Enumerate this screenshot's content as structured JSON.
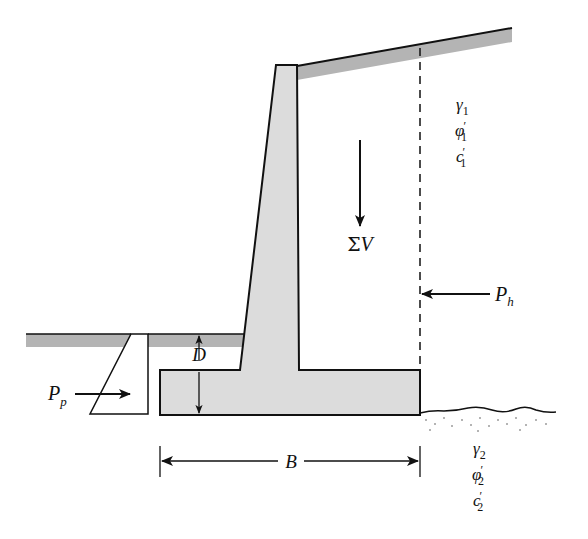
{
  "diagram": {
    "type": "cantilever-retaining-wall",
    "colors": {
      "concrete_fill": "#dcdcdc",
      "soil_strip_fill": "#b4b4b4",
      "stroke": "#111111",
      "background": "#ffffff"
    },
    "labels": {
      "vertical_force": {
        "symbol": "Σ",
        "var": "V"
      },
      "active_force": {
        "var": "P",
        "sub": "h"
      },
      "passive_force": {
        "var": "P",
        "sub": "p"
      },
      "embedment_depth": {
        "var": "D"
      },
      "base_width": {
        "var": "B"
      }
    },
    "backfill_soil": {
      "unit_weight": {
        "var": "γ",
        "sub": "1"
      },
      "friction_angle": {
        "var": "φ",
        "prime": "′",
        "sub": "1"
      },
      "cohesion": {
        "var": "c",
        "prime": "′",
        "sub": "1"
      }
    },
    "foundation_soil": {
      "unit_weight": {
        "var": "γ",
        "sub": "2"
      },
      "friction_angle": {
        "var": "φ",
        "prime": "′",
        "sub": "2"
      },
      "cohesion": {
        "var": "c",
        "prime": "′",
        "sub": "2"
      }
    }
  }
}
